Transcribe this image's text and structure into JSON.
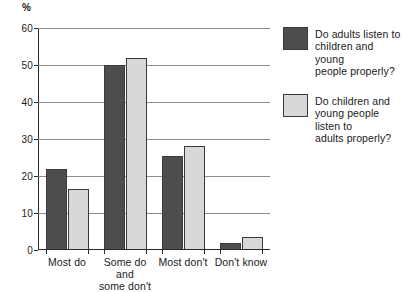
{
  "chart_data": {
    "type": "bar",
    "title": "",
    "xlabel": "",
    "ylabel": "%",
    "ylim": [
      0,
      60
    ],
    "yticks": [
      0,
      10,
      20,
      30,
      40,
      50,
      60
    ],
    "grid": true,
    "legend_position": "right",
    "categories": [
      "Most do",
      "Some do and\nsome don't",
      "Most don't",
      "Don't know"
    ],
    "series": [
      {
        "name": "Do adults listen to\nchildren and young\npeople properly?",
        "color": "#4d4d4d",
        "values": [
          22,
          50,
          25.5,
          2
        ]
      },
      {
        "name": "Do children and\nyoung people\nlisten to\nadults properly?",
        "color": "#d8d8d8",
        "values": [
          16.5,
          52,
          28,
          3.5
        ]
      }
    ]
  }
}
